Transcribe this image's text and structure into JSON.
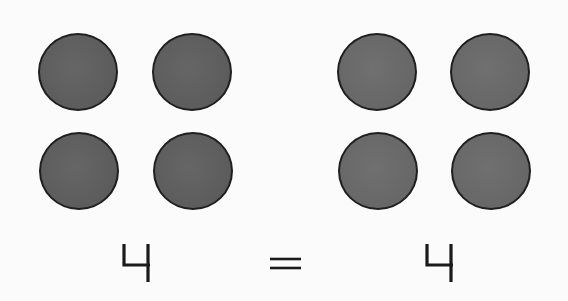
{
  "diagram": {
    "type": "counting-equality",
    "left_group": {
      "count": 4,
      "label": "4",
      "layout": "2x2",
      "color": "#5e5e5e"
    },
    "operator": {
      "symbol": "=",
      "meaning": "equals"
    },
    "right_group": {
      "count": 4,
      "label": "4",
      "layout": "2x2",
      "color": "#6a6a6a"
    },
    "outline_color": "#1f1f1f",
    "background_color": "#fbfbfb",
    "equation": "4 = 4"
  }
}
